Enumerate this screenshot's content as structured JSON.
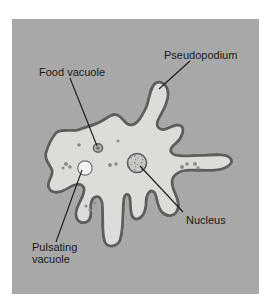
{
  "diagram": {
    "labels": {
      "pseudopodium": "Pseudopodium",
      "food_vacuole": "Food vacuole",
      "nucleus": "Nucleus",
      "pulsating_vacuole_line1": "Pulsating",
      "pulsating_vacuole_line2": "vacuole"
    },
    "colors": {
      "background": "#a8a8a8",
      "cytoplasm": "#dcdcd8",
      "membrane": "#5e5e5e",
      "granules": "#7a7a7a",
      "pulsating_vacuole": "#f4f4f2",
      "leader_lines": "#1a1a1a"
    }
  }
}
